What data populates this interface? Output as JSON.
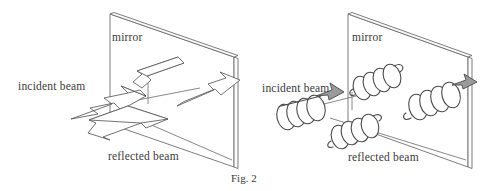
{
  "figure": {
    "caption": "Fig. 2",
    "background_color": "#ffffff",
    "line_color": "#585858",
    "coil_shadow_color": "#9a9a9a",
    "width": 501,
    "height": 191
  },
  "panels": [
    {
      "id": "left-panel",
      "representation": "block-arrows",
      "labels": {
        "mirror": "mirror",
        "incident_beam": "incident beam",
        "reflected_beam": "reflected beam"
      },
      "elements": [
        {
          "name": "mirror-plate",
          "kind": "parallelogram-plate"
        },
        {
          "name": "incident-arrow",
          "kind": "block-arrow",
          "direction": "up-right"
        },
        {
          "name": "incident-arrow-upper",
          "kind": "block-arrow",
          "direction": "down-left"
        },
        {
          "name": "reflected-arrow",
          "kind": "block-arrow",
          "direction": "down-left"
        },
        {
          "name": "reflected-arrow-upper",
          "kind": "block-arrow",
          "direction": "up-right"
        }
      ]
    },
    {
      "id": "right-panel",
      "representation": "helical-coils",
      "labels": {
        "mirror": "mirror",
        "incident_beam": "incident beam",
        "reflected_beam": "reflected beam"
      },
      "elements": [
        {
          "name": "mirror-plate",
          "kind": "parallelogram-plate"
        },
        {
          "name": "incident-helix",
          "kind": "helix",
          "direction": "up-right"
        },
        {
          "name": "incident-helix-upper",
          "kind": "helix",
          "direction": "up-right"
        },
        {
          "name": "reflected-helix",
          "kind": "helix",
          "direction": "down-left"
        },
        {
          "name": "reflected-helix-upper",
          "kind": "helix",
          "direction": "up-right"
        }
      ]
    }
  ]
}
